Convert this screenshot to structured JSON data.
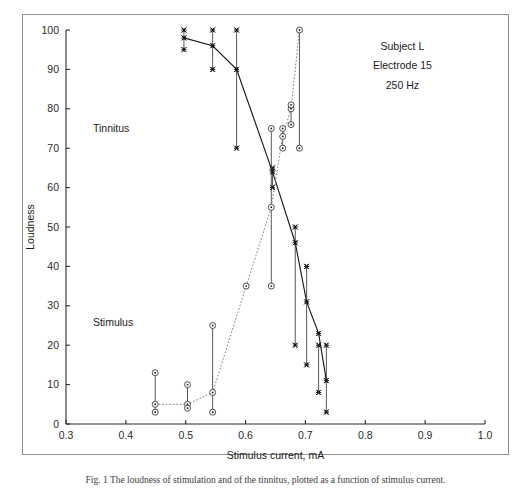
{
  "figure": {
    "caption": "Fig. 1  The loudness of stimulation and of the tinnitus, plotted as a function of stimulus current."
  },
  "annotation": {
    "line1": "Subject L",
    "line2": "Electrode 15",
    "line3": "250 Hz"
  },
  "series_labels": {
    "tinnitus": "Tinnitus",
    "stimulus": "Stimulus"
  },
  "chart_data": {
    "type": "line",
    "title": "",
    "subtitle": "",
    "xlabel": "Stimulus current, mA",
    "ylabel": "Loudness",
    "xlim": [
      0.3,
      1.0
    ],
    "ylim": [
      0,
      100
    ],
    "xticks": [
      0.3,
      0.4,
      0.5,
      0.6,
      0.7,
      0.8,
      0.9,
      1.0
    ],
    "xtick_labels": [
      "0.3",
      "0.4",
      "0.5",
      "0.6",
      "0.7",
      "0.8",
      "0.9",
      "1.0"
    ],
    "yticks": [
      0,
      10,
      20,
      30,
      40,
      50,
      60,
      70,
      80,
      90,
      100
    ],
    "ytick_labels": [
      "0",
      "10",
      "20",
      "30",
      "40",
      "50",
      "60",
      "70",
      "80",
      "90",
      "100"
    ],
    "grid": false,
    "legend": "inline-labels",
    "annotations": [
      {
        "text": "Subject L",
        "x": 0.862,
        "y": 95
      },
      {
        "text": "Electrode 15",
        "x": 0.862,
        "y": 90
      },
      {
        "text": "250 Hz",
        "x": 0.862,
        "y": 85
      },
      {
        "text": "Tinnitus",
        "x": 0.345,
        "y": 74
      },
      {
        "text": "Stimulus",
        "x": 0.345,
        "y": 25
      }
    ],
    "series": [
      {
        "name": "Tinnitus",
        "marker": "star",
        "linestyle": "solid",
        "color": "#1a1a1a",
        "x": [
          0.497,
          0.545,
          0.585,
          0.645,
          0.683,
          0.702,
          0.722,
          0.735
        ],
        "values": [
          98,
          96,
          90,
          64,
          46,
          31,
          23,
          11
        ],
        "err_low": [
          95,
          90,
          70,
          60,
          20,
          15,
          8,
          3
        ],
        "err_high": [
          100,
          100,
          100,
          65,
          50,
          40,
          20,
          20
        ]
      },
      {
        "name": "Stimulus",
        "marker": "circle-dot",
        "linestyle": "dotted",
        "color": "#6b6b6b",
        "x": [
          0.449,
          0.503,
          0.545,
          0.601,
          0.643,
          0.662,
          0.676,
          0.69
        ],
        "values": [
          5,
          5,
          8,
          35,
          55,
          73,
          80,
          100
        ],
        "err_low": [
          3,
          4,
          3,
          35,
          35,
          70,
          76,
          70
        ],
        "err_high": [
          13,
          10,
          25,
          35,
          75,
          75,
          81,
          100
        ]
      }
    ]
  }
}
